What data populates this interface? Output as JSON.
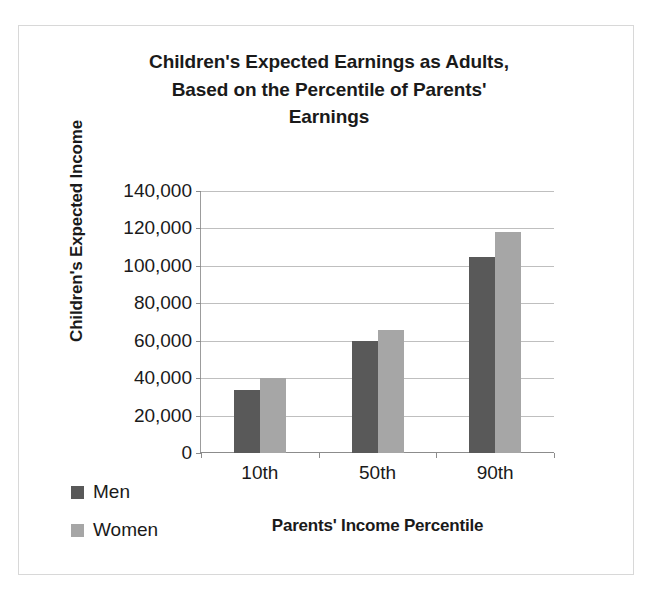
{
  "chart_data": {
    "type": "bar",
    "title": "Children's Expected Earnings as Adults, Based on the Percentile of Parents' Earnings",
    "title_lines": [
      "Children's Expected Earnings as Adults,",
      "Based on the Percentile of Parents'",
      "Earnings"
    ],
    "xlabel": "Parents' Income Percentile",
    "ylabel": "Children's Expected Income",
    "categories": [
      "10th",
      "50th",
      "90th"
    ],
    "series": [
      {
        "name": "Men",
        "color": "#595959",
        "values": [
          33500,
          60000,
          105000
        ]
      },
      {
        "name": "Women",
        "color": "#a6a6a6",
        "values": [
          40000,
          66000,
          118000
        ]
      }
    ],
    "ylim": [
      0,
      140000
    ],
    "ytick_step": 20000,
    "ytick_labels": [
      "0",
      "20,000",
      "40,000",
      "60,000",
      "80,000",
      "100,000",
      "120,000",
      "140,000"
    ],
    "ytick_values": [
      0,
      20000,
      40000,
      60000,
      80000,
      100000,
      120000,
      140000
    ],
    "grid": true,
    "grid_axis": "y",
    "legend_position": "bottom-left",
    "legend_entries": [
      "Men",
      "Women"
    ]
  },
  "legend": {
    "items": [
      {
        "label": "Men",
        "color": "#595959"
      },
      {
        "label": "Women",
        "color": "#a6a6a6"
      }
    ]
  },
  "colors": {
    "men": "#595959",
    "women": "#a6a6a6",
    "gridline": "#bfbfbf",
    "axis": "#8c8c8c",
    "border": "#d8d8d8",
    "background": "#ffffff",
    "text": "#1a1a1a"
  }
}
